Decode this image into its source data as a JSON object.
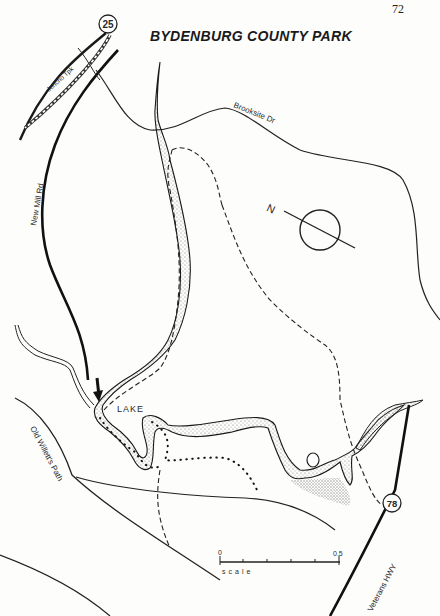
{
  "page": {
    "number": "72"
  },
  "map": {
    "title": "BYDENBURG COUNTY PARK",
    "roads": [
      {
        "name": "Jericho Tpk",
        "style": "double-dashed"
      },
      {
        "name": "New Mill Rd",
        "style": "heavy"
      },
      {
        "name": "Brooksite Dr",
        "style": "thin"
      },
      {
        "name": "Old Willett's Path",
        "style": "thin"
      },
      {
        "name": "Veterans HWY",
        "style": "heavy"
      }
    ],
    "route_shields": [
      {
        "number": "25"
      },
      {
        "number": "78"
      }
    ],
    "water": {
      "label": "LAKE"
    },
    "compass": {
      "label": "N"
    },
    "scale": {
      "start": "0",
      "end": "0.5",
      "label": "scale"
    },
    "legend_notes": {
      "dashed_lines": "trails",
      "dotted_lines": "shoreline path",
      "arrow": "entrance"
    }
  }
}
